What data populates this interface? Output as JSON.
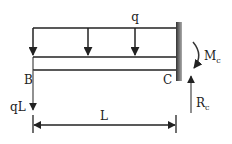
{
  "diagram": {
    "labels": {
      "load": "q",
      "left_end": "B",
      "right_end": "C",
      "point_force": "qL",
      "length": "L",
      "moment_main": "M",
      "moment_sub": "c",
      "reaction_main": "R",
      "reaction_sub": "c"
    },
    "colors": {
      "stroke": "#222222",
      "wall_dark": "#333333",
      "wall_light": "#999999"
    }
  }
}
